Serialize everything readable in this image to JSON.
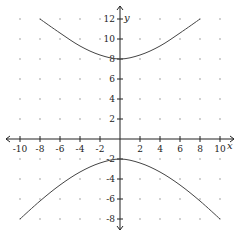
{
  "chart_data": {
    "type": "line",
    "title": "",
    "xlabel": "x",
    "ylabel": "y",
    "xlim": [
      -10,
      10
    ],
    "ylim": [
      -8,
      12
    ],
    "x_ticks": [
      -10,
      -8,
      -6,
      -4,
      -2,
      2,
      4,
      6,
      8,
      10
    ],
    "y_ticks": [
      -8,
      -6,
      -4,
      -2,
      2,
      4,
      6,
      8,
      10,
      12
    ],
    "grid": "dots every 2 units",
    "legend": null,
    "series": [
      {
        "name": "upper branch",
        "points": [
          [
            -8,
            12
          ],
          [
            -6,
            10.6
          ],
          [
            -4,
            9.3
          ],
          [
            -2,
            8.4
          ],
          [
            0,
            8
          ],
          [
            2,
            8.4
          ],
          [
            4,
            9.3
          ],
          [
            6,
            10.6
          ],
          [
            8,
            12
          ]
        ]
      },
      {
        "name": "lower branch",
        "points": [
          [
            -10,
            -8
          ],
          [
            -8,
            -6.2
          ],
          [
            -6,
            -4.6
          ],
          [
            -4,
            -3.3
          ],
          [
            -2,
            -2.4
          ],
          [
            0,
            -2
          ],
          [
            2,
            -2.4
          ],
          [
            4,
            -3.3
          ],
          [
            6,
            -4.6
          ],
          [
            8,
            -6.2
          ],
          [
            10,
            -8
          ]
        ]
      }
    ],
    "style": {
      "curve_color": "#444444",
      "axis_color": "#222222",
      "dot_color": "#999999"
    }
  }
}
